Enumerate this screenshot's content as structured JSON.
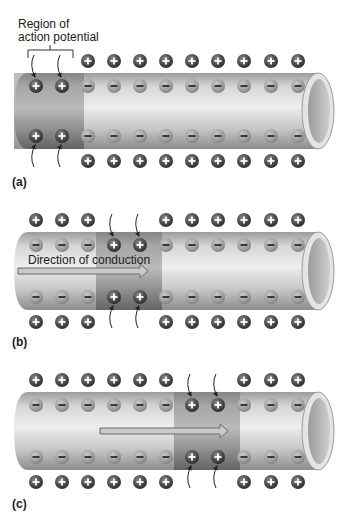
{
  "figure": {
    "annotation": {
      "line1": "Region of",
      "line2": "action potential"
    },
    "panels": [
      {
        "label": "(a)",
        "depolarized_columns": [
          0,
          1
        ],
        "arrow_label": "",
        "arrow": null
      },
      {
        "label": "(b)",
        "depolarized_columns": [
          3,
          4
        ],
        "arrow_label": "Direction of conduction",
        "arrow": {
          "x1": 18,
          "x2": 148
        }
      },
      {
        "label": "(c)",
        "depolarized_columns": [
          6,
          7
        ],
        "arrow_label": "",
        "arrow": {
          "x1": 100,
          "x2": 228
        }
      }
    ],
    "ion_symbols": {
      "positive": "+",
      "negative": "−"
    },
    "charge_columns_x": [
      36,
      62,
      88,
      114,
      140,
      166,
      192,
      218,
      244,
      271,
      298
    ],
    "colors": {
      "tube_light": "#e6e6e6",
      "tube_mid": "#bdbdbd",
      "tube_dark": "#8a8a8a",
      "depolarized": "#6e6e6e",
      "ion_positive": "#4a4a4a",
      "ion_negative": "#9a9a9a",
      "arrow_fill": "#c9c9c9",
      "arrow_stroke": "#6a6a6a"
    }
  }
}
